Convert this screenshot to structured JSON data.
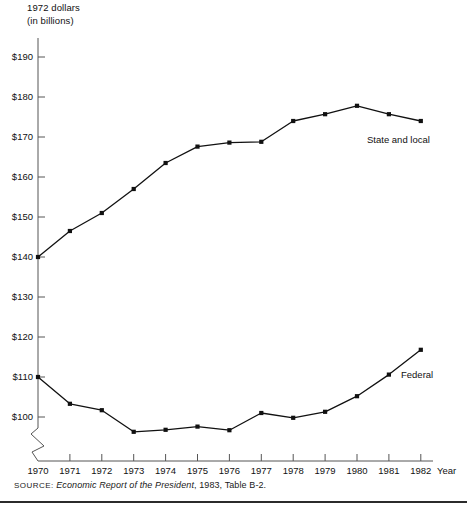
{
  "chart_data": {
    "type": "line",
    "title": "",
    "ylabel": "1972 dollars\n(in billions)",
    "ylabel_line1": "1972 dollars",
    "ylabel_line2": "(in billions)",
    "xlabel": "Year",
    "x": [
      1970,
      1971,
      1972,
      1973,
      1974,
      1975,
      1976,
      1977,
      1978,
      1979,
      1980,
      1981,
      1982
    ],
    "xtick_labels": [
      "1970",
      "1971",
      "1972",
      "1973",
      "1974",
      "1975",
      "1976",
      "1977",
      "1978",
      "1979",
      "1980",
      "1981",
      "1982"
    ],
    "ytick_labels": [
      "$100",
      "$110",
      "$120",
      "$130",
      "$140",
      "$150",
      "$160",
      "$170",
      "$180",
      "$190"
    ],
    "ytick_values": [
      100,
      110,
      120,
      130,
      140,
      150,
      160,
      170,
      180,
      190
    ],
    "ylim": [
      100,
      190
    ],
    "y_axis_break": true,
    "grid": false,
    "legend_position": "inline-right",
    "series": [
      {
        "name": "State and local",
        "label": "State and local",
        "color": "#111111",
        "marker": "square",
        "values": [
          140.0,
          146.5,
          151.0,
          157.0,
          163.5,
          167.6,
          168.6,
          168.8,
          174.0,
          175.7,
          177.8,
          175.7,
          174.0
        ]
      },
      {
        "name": "Federal",
        "label": "Federal",
        "color": "#111111",
        "marker": "square",
        "values": [
          110.0,
          103.3,
          101.7,
          96.3,
          96.8,
          97.6,
          96.7,
          101.0,
          99.8,
          101.3,
          105.2,
          110.6,
          116.8
        ]
      }
    ]
  },
  "source": {
    "keyword": "SOURCE:",
    "publication": "Economic Report of the President",
    "citation": ", 1983, Table B-2."
  }
}
